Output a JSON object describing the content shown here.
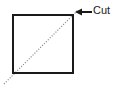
{
  "figure": {
    "background_color": "#ffffff",
    "width": 118,
    "height": 93
  },
  "shape": {
    "name": "square",
    "type": "rectangle",
    "stroke_color": "#1a1a1a",
    "fill_color": "#ffffff",
    "stroke_width": 1.4,
    "x": 13,
    "y": 15,
    "width": 60,
    "height": 58
  },
  "cut_line": {
    "name": "diagonal-cut-line",
    "style": "dotted",
    "stroke_color": "#8a8a8a",
    "stroke_width": 1.2,
    "dash_pattern": "1.1 1.6",
    "start_x": 4,
    "start_y": 84,
    "end_x": 78,
    "end_y": 10
  },
  "annotation": {
    "label": "Cut",
    "text_color": "#1a1a1a",
    "leader_line": {
      "name": "cut-leader-line",
      "stroke_color": "#1a1a1a",
      "stroke_width": 1.2,
      "from_x": 92,
      "from_y": 12,
      "to_x": 80,
      "to_y": 12
    },
    "arrow_head": {
      "name": "cut-arrow-head",
      "direction": "left",
      "tip_x": 75,
      "tip_y": 12,
      "fill_color": "#1a1a1a"
    }
  }
}
